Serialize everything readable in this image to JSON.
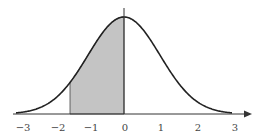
{
  "chart_data": {
    "type": "area",
    "title": "",
    "xlabel": "",
    "ylabel": "",
    "xlim": [
      -3.3,
      3.5
    ],
    "x_ticks": [
      "−3",
      "−2",
      "−1",
      "0",
      "1",
      "2",
      "3"
    ],
    "x_tick_values": [
      -3,
      -2,
      -1,
      0,
      1,
      2,
      3
    ],
    "curve": {
      "mean": 0,
      "sd": 1,
      "x_range": [
        -3,
        3
      ]
    },
    "shaded_region": {
      "from": -1.5,
      "to": 0,
      "color": "#c4c4c4"
    },
    "vertical_line": {
      "x": 0
    },
    "grid": false,
    "legend": null,
    "colors": {
      "curve": "#222222",
      "shade": "#c4c4c4",
      "axis": "#333333"
    }
  }
}
